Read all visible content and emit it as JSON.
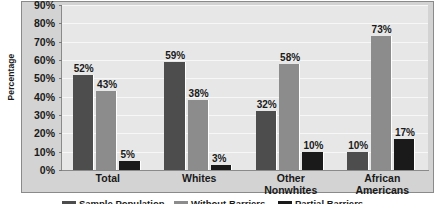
{
  "chart_data": {
    "type": "bar",
    "title": "",
    "xlabel": "",
    "ylabel": "Percentage",
    "ylim": [
      0,
      90
    ],
    "grid": true,
    "legend_position": "bottom",
    "categories": [
      "Total",
      "Whites",
      "Other\nNonwhites",
      "African\nAmericans"
    ],
    "ytick_labels": [
      "0%",
      "10%",
      "20%",
      "30%",
      "40%",
      "50%",
      "60%",
      "70%",
      "80%",
      "90%"
    ],
    "ytick_values": [
      0,
      10,
      20,
      30,
      40,
      50,
      60,
      70,
      80,
      90
    ],
    "series": [
      {
        "name": "Sample Population",
        "color": "#4d4d4d",
        "values": [
          52,
          59,
          32,
          10
        ],
        "labels": [
          "52%",
          "59%",
          "32%",
          "10%"
        ]
      },
      {
        "name": "Without Barriers",
        "color": "#8c8c8c",
        "values": [
          43,
          38,
          58,
          73
        ],
        "labels": [
          "43%",
          "38%",
          "58%",
          "73%"
        ]
      },
      {
        "name": "Partial Barriers",
        "color": "#1a1a1a",
        "values": [
          5,
          3,
          10,
          17
        ],
        "labels": [
          "5%",
          "3%",
          "10%",
          "17%"
        ]
      }
    ]
  },
  "colors": {
    "panel_background": "#d3d3d3",
    "plot_background": "#e7e7e7",
    "gridline": "#f7f7f7",
    "axis": "#8a8a8a",
    "text": "#1a1a1a"
  }
}
